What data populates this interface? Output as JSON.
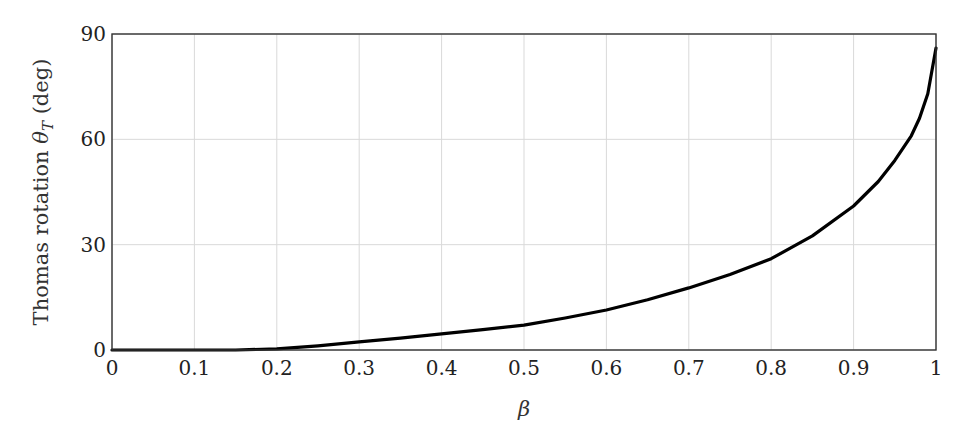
{
  "chart_data": {
    "type": "line",
    "title": "",
    "xlabel": "β",
    "ylabel": "Thomas rotation θ_T (deg)",
    "ylabel_parts": {
      "prefix": "Thomas rotation ",
      "symbol": "θ",
      "subscript": "T",
      "suffix": " (deg)"
    },
    "xlim": [
      0,
      1
    ],
    "ylim": [
      0,
      90
    ],
    "x_ticks": [
      0,
      0.1,
      0.2,
      0.3,
      0.4,
      0.5,
      0.6,
      0.7,
      0.8,
      0.9,
      1
    ],
    "x_tick_labels": [
      "0",
      "0.1",
      "0.2",
      "0.3",
      "0.4",
      "0.5",
      "0.6",
      "0.7",
      "0.8",
      "0.9",
      "1"
    ],
    "y_ticks": [
      0,
      30,
      60,
      90
    ],
    "y_tick_labels": [
      "0",
      "30",
      "60",
      "90"
    ],
    "grid": true,
    "legend": null,
    "series": [
      {
        "name": "Thomas rotation",
        "color": "#000000",
        "x": [
          0,
          0.05,
          0.1,
          0.15,
          0.2,
          0.25,
          0.3,
          0.35,
          0.4,
          0.45,
          0.5,
          0.55,
          0.6,
          0.65,
          0.7,
          0.75,
          0.8,
          0.85,
          0.9,
          0.93,
          0.95,
          0.97,
          0.98,
          0.99,
          1.0
        ],
        "y": [
          0,
          0,
          0,
          0,
          0.3,
          1.2,
          2.3,
          3.4,
          4.6,
          5.8,
          7.1,
          9.1,
          11.4,
          14.3,
          17.7,
          21.5,
          26.0,
          32.5,
          41.0,
          48.0,
          54.0,
          61.0,
          66.0,
          73.0,
          86.0
        ]
      }
    ]
  }
}
